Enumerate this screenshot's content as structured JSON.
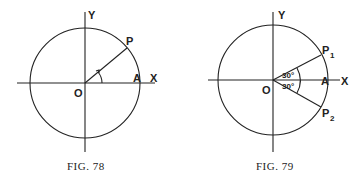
{
  "figures": [
    {
      "caption": "FIG. 78",
      "labels": {
        "y_axis": "Y",
        "x_axis": "X",
        "origin": "O",
        "point_a": "A",
        "point_p": "P"
      }
    },
    {
      "caption": "FIG. 79",
      "labels": {
        "y_axis": "Y",
        "x_axis": "X",
        "origin": "O",
        "point_a": "A",
        "point_p1": "P",
        "p1_sub": "1",
        "point_p2": "P",
        "p2_sub": "2",
        "angle_upper": "30°",
        "angle_lower": "30°"
      }
    }
  ],
  "colors": {
    "ink": "#222222",
    "background": "#ffffff"
  }
}
